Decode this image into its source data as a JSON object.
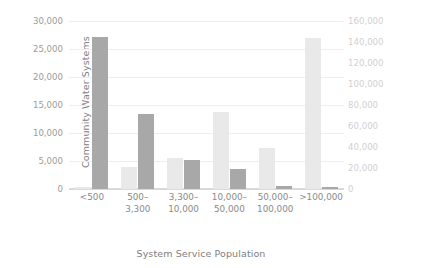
{
  "chart_data": {
    "type": "bar",
    "title": "",
    "subtitle": "",
    "xlabel": "System Service Population",
    "categories": [
      "<500",
      "500–\n3,300",
      "3,300–\n10,000",
      "10,000–\n50,000",
      "50,000–\n100,000",
      ">100,000"
    ],
    "grid": true,
    "legend_position": "none",
    "axes": {
      "left": {
        "label": "Community Water Systems",
        "ylim": [
          0,
          30000
        ],
        "tick_step": 5000,
        "ticks": [
          "0",
          "5,000",
          "10,000",
          "15,000",
          "20,000",
          "25,000",
          "30,000"
        ],
        "tick_values": [
          0,
          5000,
          10000,
          15000,
          20000,
          25000,
          30000
        ],
        "color": "#9b9b9b"
      },
      "right": {
        "label": "Total Population Served (thousands)",
        "ylim": [
          0,
          160000
        ],
        "tick_step": 20000,
        "ticks": [
          "0",
          "20,000",
          "40,000",
          "60,000",
          "80,000",
          "100,000",
          "120,000",
          "140,000",
          "160,000"
        ],
        "tick_values": [
          0,
          20000,
          40000,
          60000,
          80000,
          100000,
          120000,
          140000,
          160000
        ],
        "color": "#d2cfcf"
      }
    },
    "series": [
      {
        "name": "Total Population Served (thousands)",
        "axis": "right",
        "color": "#e9e9e9",
        "values": [
          1500,
          21000,
          30000,
          73500,
          39500,
          143500
        ]
      },
      {
        "name": "Community Water Systems",
        "axis": "left",
        "color": "#a8a8a8",
        "values": [
          27100,
          13400,
          5200,
          3500,
          500,
          400
        ]
      }
    ]
  }
}
